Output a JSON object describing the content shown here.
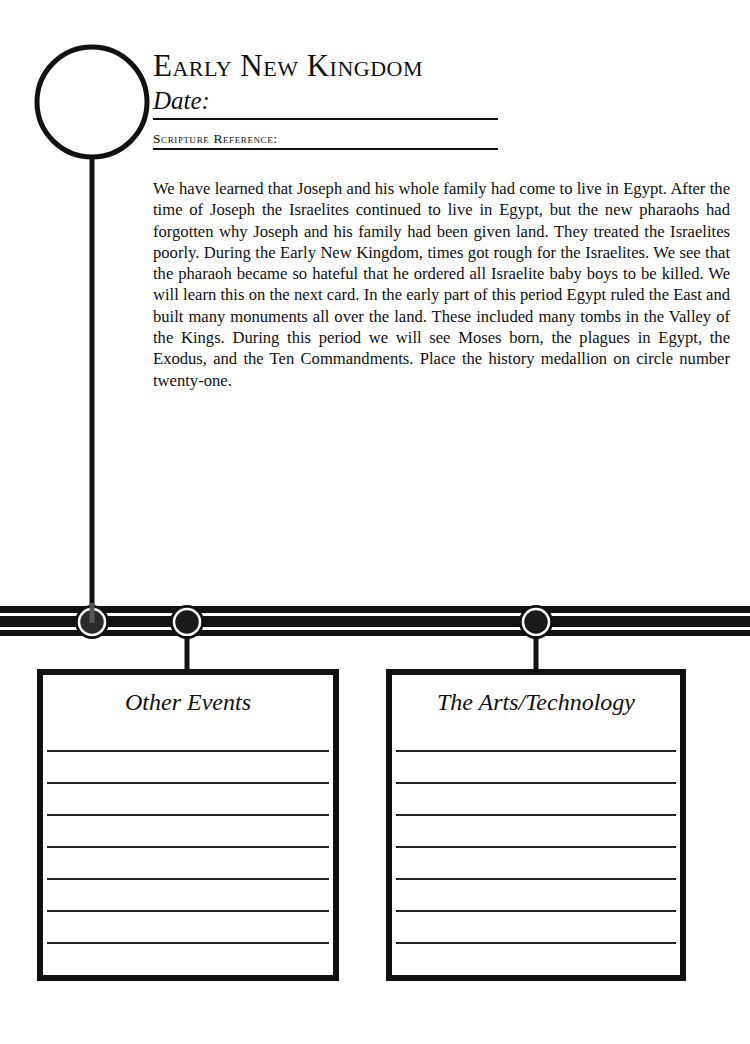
{
  "header": {
    "title": "Early New Kingdom",
    "date_label": "Date:",
    "scripture_label": "Scripture Reference:"
  },
  "body": {
    "paragraph": "We have learned that Joseph and his whole family had come to live in Egypt. After the time of Joseph the Israelites continued to live in Egypt, but the new pharaohs had forgotten why Joseph and his family had been given land. They treated the Israelites poorly. During the Early New Kingdom, times got rough for the Israelites. We see that the pharaoh became so hateful that he ordered all Israelite baby boys to be killed. We will learn this on the next card. In the early part of this period Egypt ruled the East and built many monuments all over the land. These included many tombs in the Valley of the Kings. During this period we will see Moses born, the plagues in Egypt, the Exodus, and the Ten Commandments. Place the history medallion on circle number twenty-one."
  },
  "boxes": [
    {
      "title": "Other Events",
      "line_count": 7
    },
    {
      "title": "The Arts/Technology",
      "line_count": 7
    }
  ],
  "colors": {
    "ink": "#111111",
    "paper": "#ffffff"
  }
}
